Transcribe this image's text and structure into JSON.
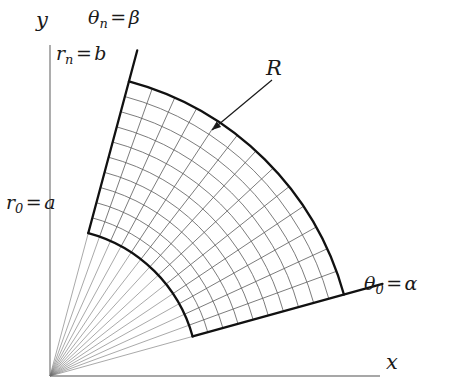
{
  "figure": {
    "background_color": "#ffffff",
    "width": 453,
    "height": 392
  },
  "axes": {
    "x_label": "x",
    "y_label": "y",
    "origin": {
      "x": 50,
      "y": 376
    },
    "x_axis_end": {
      "x": 380,
      "y": 376
    },
    "y_axis_top": {
      "x": 50,
      "y": 45
    },
    "color": "#8a8a8a"
  },
  "labels": {
    "region": "R",
    "inner_radius": {
      "symbol": "r",
      "subscript": "0",
      "equals": "=",
      "value": "a"
    },
    "outer_radius": {
      "symbol": "r",
      "subscript": "n",
      "equals": "=",
      "value": "b"
    },
    "start_angle": {
      "symbol": "θ",
      "subscript": "0",
      "equals": "=",
      "value": "α"
    },
    "end_angle": {
      "symbol": "θ",
      "subscript": "n",
      "equals": "=",
      "value": "β"
    }
  },
  "chart_data": {
    "type": "diagram",
    "subtype": "polar-sector-grid",
    "origin": {
      "x": 50,
      "y": 376
    },
    "r_inner": 148,
    "r_outer": 305,
    "theta_start_deg": 15.5,
    "theta_end_deg": 75.0,
    "n_radial_divisions": 10,
    "n_angular_divisions": 13,
    "theta_ray_overshoot_outer": 14,
    "boundary_stroke": "#111111",
    "boundary_width": 2.3,
    "grid_stroke": "#5a5a5a",
    "grid_width": 0.8,
    "fan_stroke": "#6e6e6e",
    "fan_width": 0.6,
    "arrow": {
      "label": "R",
      "tail": {
        "x": 272,
        "y": 80
      },
      "head": {
        "x": 212,
        "y": 130
      }
    },
    "axis_labels": {
      "x": "x",
      "y": "y"
    },
    "boundary_labels": [
      {
        "text": "r_0 = a",
        "kind": "inner-arc"
      },
      {
        "text": "r_n = b",
        "kind": "outer-arc"
      },
      {
        "text": "theta_0 = alpha",
        "kind": "start-ray"
      },
      {
        "text": "theta_n = beta",
        "kind": "end-ray"
      }
    ]
  }
}
